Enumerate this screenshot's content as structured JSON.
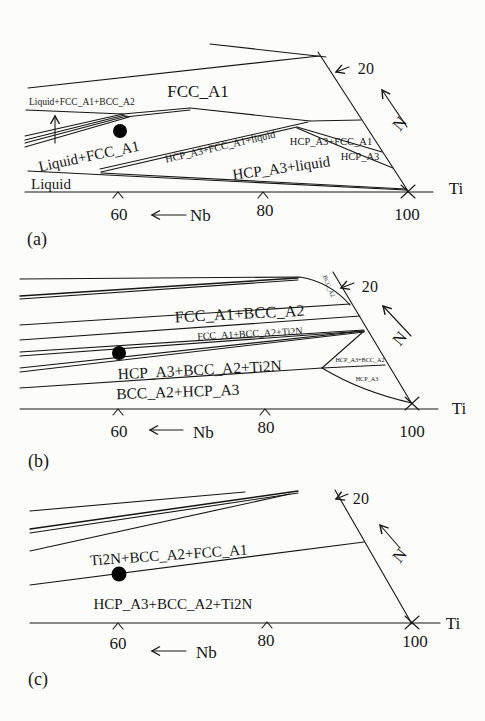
{
  "colors": {
    "ink": "#161616",
    "dot": "#000000",
    "background": "#fcfcfa"
  },
  "panel_a": {
    "tag": "(a)",
    "regions": {
      "fcc_a1": "FCC_A1",
      "liquid_fcc_bcc": "Liquid+FCC_A1+BCC_A2",
      "liquid_fcc": "Liquid+FCC_A1",
      "liquid": "Liquid",
      "hcp_fcc_liquid": "HCP_A3+FCC_A1+liquid",
      "hcp_liquid": "HCP_A3+liquid",
      "hcp_fcc": "HCP_A3+FCC_A1",
      "hcp": "HCP_A3"
    },
    "axis": {
      "n_tick_20": "20",
      "n_label": "N",
      "nb_label": "Nb",
      "ti_label": "Ti",
      "tick_60": "60",
      "tick_80": "80",
      "tick_100": "100"
    }
  },
  "panel_b": {
    "tag": "(b)",
    "regions": {
      "fcc_bcc": "FCC_A1+BCC_A2",
      "fcc_bcc_ti2n": "FCC_A1+BCC_A2+Ti2N",
      "hcp_bcc_ti2n": "HCP_A3+BCC_A2+Ti2N",
      "bcc_hcp": "BCC_A2+HCP_A3",
      "hcp_bcc_small": "HCP_A3+BCC_A2",
      "hcp_small": "HCP_A3",
      "bcc_edge": "BCC_A2"
    },
    "axis": {
      "n_tick_20": "20",
      "n_label": "N",
      "nb_label": "Nb",
      "ti_label": "Ti",
      "tick_60": "60",
      "tick_80": "80",
      "tick_100": "100"
    }
  },
  "panel_c": {
    "tag": "(c)",
    "regions": {
      "ti2n_bcc_fcc": "Ti2N+BCC_A2+FCC_A1",
      "hcp_bcc_ti2n": "HCP_A3+BCC_A2+Ti2N"
    },
    "axis": {
      "n_tick_20": "20",
      "n_label": "N",
      "nb_label": "Nb",
      "ti_label": "Ti",
      "tick_60": "60",
      "tick_80": "80",
      "tick_100": "100"
    }
  }
}
